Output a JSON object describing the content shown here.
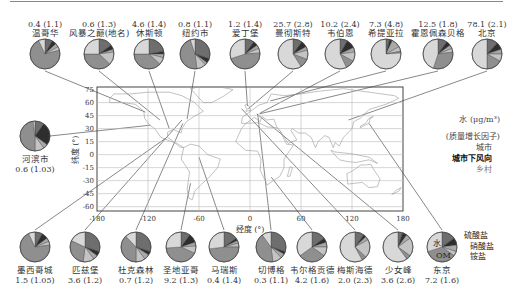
{
  "chart_data": {
    "type": "pie",
    "title": "",
    "map": {
      "xlabel": "经度 (°)",
      "ylabel": "纬度 (°)",
      "xticks": [
        -180,
        -120,
        -60,
        0,
        60,
        120,
        180
      ],
      "yticks": [
        75,
        60,
        45,
        30,
        15,
        0,
        -15,
        -30,
        -45,
        -60
      ],
      "xlim": [
        -180,
        180
      ],
      "ylim": [
        -65,
        80
      ],
      "grid": true
    },
    "legend": {
      "value_label": "水 (μg/m³)",
      "factor_label": "(质量增长因子)",
      "site_types": [
        "城市",
        "城市下风向",
        "乡村"
      ],
      "components": [
        "硫酸盐",
        "硝酸盐",
        "铵盐",
        "OM",
        "水"
      ]
    },
    "components_order": [
      "硫酸盐",
      "硝酸盐",
      "铵盐",
      "其他",
      "OM",
      "水"
    ],
    "sites": [
      {
        "name": "温哥华",
        "value": "0.4",
        "factor": "(1.1)",
        "lon": -123,
        "lat": 49,
        "slices": [
          8,
          5,
          4,
          4,
          72,
          7
        ]
      },
      {
        "name": "风暴之巅(地名)",
        "value": "0.6",
        "factor": "(1.3)",
        "lon": -106,
        "lat": 40,
        "slices": [
          15,
          5,
          3,
          14,
          38,
          25
        ]
      },
      {
        "name": "休斯顿",
        "value": "4.6",
        "factor": "(1.4)",
        "lon": -95,
        "lat": 30,
        "slices": [
          22,
          3,
          4,
          8,
          38,
          25
        ]
      },
      {
        "name": "纽约市",
        "value": "0.8",
        "factor": "(1.1)",
        "lon": -74,
        "lat": 41,
        "slices": [
          30,
          5,
          3,
          10,
          47,
          5
        ]
      },
      {
        "name": "爱丁堡",
        "value": "1.2",
        "factor": "(1.4)",
        "lon": -3,
        "lat": 56,
        "slices": [
          10,
          5,
          4,
          5,
          46,
          30
        ]
      },
      {
        "name": "曼彻斯特",
        "value": "25.7",
        "factor": "(2.8)",
        "lon": -2,
        "lat": 53,
        "slices": [
          10,
          7,
          4,
          10,
          10,
          59
        ]
      },
      {
        "name": "韦伯恩",
        "value": "10.2",
        "factor": "(2.4)",
        "lon": 12,
        "lat": 48,
        "slices": [
          8,
          10,
          5,
          10,
          10,
          57
        ]
      },
      {
        "name": "希提亚拉",
        "value": "7.3",
        "factor": "(4.8)",
        "lon": 24,
        "lat": 62,
        "slices": [
          4,
          3,
          10,
          5,
          2,
          76
        ]
      },
      {
        "name": "霍恩佩森贝格",
        "value": "12.5",
        "factor": "(1.8)",
        "lon": 11,
        "lat": 47,
        "slices": [
          10,
          5,
          4,
          4,
          32,
          45
        ]
      },
      {
        "name": "北京",
        "value": "78.1",
        "factor": "(2.1)",
        "lon": 116,
        "lat": 40,
        "slices": [
          12,
          8,
          5,
          8,
          17,
          50
        ]
      },
      {
        "name": "河滨市",
        "value": "0.6",
        "factor": "(1.03)",
        "lon": -117,
        "lat": 34,
        "slices": [
          10,
          25,
          5,
          10,
          48,
          2
        ]
      },
      {
        "name": "墨西哥城",
        "value": "1.5",
        "factor": "(1.05)",
        "lon": -99,
        "lat": 19,
        "slices": [
          8,
          7,
          4,
          4,
          70,
          7
        ]
      },
      {
        "name": "匹兹堡",
        "value": "3.6",
        "factor": "(1.2)",
        "lon": -80,
        "lat": 40,
        "slices": [
          30,
          5,
          5,
          12,
          30,
          18
        ]
      },
      {
        "name": "杜克森林",
        "value": "0.7",
        "factor": "(1.2)",
        "lon": -79,
        "lat": 36,
        "slices": [
          30,
          4,
          6,
          10,
          38,
          12
        ]
      },
      {
        "name": "圣地亚哥",
        "value": "9.2",
        "factor": "(1.3)",
        "lon": -70,
        "lat": -33,
        "slices": [
          10,
          10,
          4,
          8,
          42,
          26
        ]
      },
      {
        "name": "马瑞斯",
        "value": "0.4",
        "factor": "(1.4)",
        "lon": -60,
        "lat": -3,
        "slices": [
          15,
          3,
          3,
          4,
          48,
          27
        ]
      },
      {
        "name": "切博格",
        "value": "0.3",
        "factor": "(1.1)",
        "lon": 9,
        "lat": 47,
        "slices": [
          30,
          3,
          5,
          10,
          42,
          10
        ]
      },
      {
        "name": "韦尔格贡德",
        "value": "4.2",
        "factor": "(1.6)",
        "lon": 25,
        "lat": -26,
        "slices": [
          15,
          5,
          5,
          10,
          30,
          35
        ]
      },
      {
        "name": "梅斯海德",
        "value": "2.0",
        "factor": "(2.3)",
        "lon": -10,
        "lat": 53,
        "slices": [
          10,
          3,
          4,
          20,
          5,
          58
        ]
      },
      {
        "name": "少女峰",
        "value": "3.6",
        "factor": "(2.6)",
        "lon": 8,
        "lat": 47,
        "slices": [
          5,
          5,
          5,
          20,
          5,
          60
        ]
      },
      {
        "name": "东京",
        "value": "7.2",
        "factor": "(1.6)",
        "lon": 140,
        "lat": 36,
        "slices": [
          15,
          8,
          7,
          5,
          35,
          30
        ]
      }
    ]
  },
  "labels": {
    "xlabel": "经度 (°)",
    "ylabel": "纬度 (°)",
    "legend_value": "水 (μg/m³)",
    "legend_factor": "(质量增长因子)",
    "legend_urban": "城市",
    "legend_downwind": "城市下风向",
    "legend_rural": "乡村",
    "comp_sulfate": "硫酸盐",
    "comp_nitrate": "硝酸盐",
    "comp_ammonium": "铵盐",
    "comp_om": "OM",
    "comp_water": "水"
  },
  "colors": {
    "sulfate": "#6e6e6e",
    "nitrate": "#2e2e2e",
    "ammonium": "#a9a9a9",
    "other": "#c4c4c4",
    "om": "#8f8f8f",
    "water": "#d8d8d8",
    "outline": "#444444",
    "grid": "#bbbbbb",
    "line": "#555555"
  }
}
